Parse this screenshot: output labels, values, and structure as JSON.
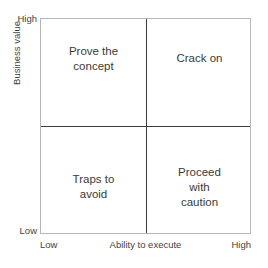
{
  "chart_data": {
    "type": "scatter",
    "title": "",
    "subtitle": "",
    "xlabel": "Ability to execute",
    "ylabel": "Business value",
    "xticklabels": [
      "Low",
      "High"
    ],
    "yticklabels": [
      "Low",
      "High"
    ],
    "xlim": [
      "Low",
      "High"
    ],
    "ylim": [
      "Low",
      "High"
    ],
    "grid": true,
    "legend": "none",
    "annotations": [
      {
        "quadrant": "top-left",
        "x": "low",
        "y": "high",
        "label": "Prove the\nconcept"
      },
      {
        "quadrant": "top-right",
        "x": "high",
        "y": "high",
        "label": "Crack on"
      },
      {
        "quadrant": "bottom-left",
        "x": "low",
        "y": "low",
        "label": "Traps to\navoid"
      },
      {
        "quadrant": "bottom-right",
        "x": "high",
        "y": "low",
        "label": "Proceed\nwith\ncaution"
      }
    ],
    "colors": {
      "background": "#ffffff",
      "outer_border": "#b6b6b6",
      "divider": "#3d3d3d",
      "text": "#3a3a3a",
      "axis_text": "#3f3f3f"
    }
  },
  "axes": {
    "y": {
      "title": "Business value",
      "high_label": "High",
      "low_label": "Low"
    },
    "x": {
      "title": "Ability to execute",
      "low_label": "Low",
      "high_label": "High"
    }
  },
  "quadrants": {
    "top_left": "Prove the\nconcept",
    "top_right": "Crack on",
    "bottom_left": "Traps to\navoid",
    "bottom_right": "Proceed\nwith\ncaution"
  }
}
